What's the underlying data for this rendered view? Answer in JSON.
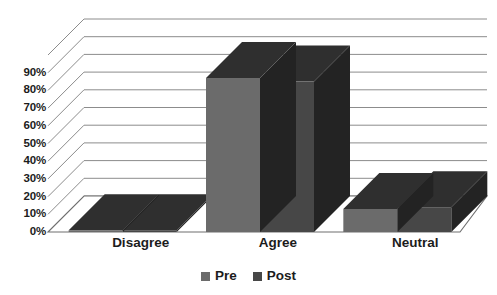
{
  "chart_data": {
    "type": "bar",
    "title": "",
    "subtitle": "",
    "xlabel": "",
    "ylabel": "",
    "categories": [
      "Disagree",
      "Agree",
      "Neutral"
    ],
    "series": [
      {
        "name": "Pre",
        "values": [
          1,
          87,
          13
        ],
        "color": "#6b6b6b"
      },
      {
        "name": "Post",
        "values": [
          1,
          85,
          14
        ],
        "color": "#474747"
      }
    ],
    "ylim": [
      0,
      100
    ],
    "ytick_values": [
      0,
      10,
      20,
      30,
      40,
      50,
      60,
      70,
      80,
      90
    ],
    "ytick_labels": [
      "0%",
      "10%",
      "20%",
      "30%",
      "40%",
      "50%",
      "60%",
      "70%",
      "80%",
      "90%"
    ],
    "grid": true,
    "gridline_count": 11,
    "legend_position": "bottom",
    "three_d": true,
    "value_format": "percent"
  },
  "legend": {
    "items": [
      {
        "label": "Pre",
        "swatch_color": "#6b6b6b"
      },
      {
        "label": "Post",
        "swatch_color": "#474747"
      }
    ]
  },
  "axis": {
    "y_labels": [
      "90%",
      "80%",
      "70%",
      "60%",
      "50%",
      "40%",
      "30%",
      "20%",
      "10%",
      "0%"
    ],
    "x_labels": [
      "Disagree",
      "Agree",
      "Neutral"
    ]
  },
  "style": {
    "background": "#ffffff",
    "gridline_color": "#8c8c8c",
    "axis_text_color": "#1c1c1c",
    "bar_pre_front": "#6b6b6b",
    "bar_post_front": "#474747",
    "bar_top_face": "#2f2f2f",
    "bar_side_face": "#232323",
    "floor_color": "#ffffff"
  }
}
